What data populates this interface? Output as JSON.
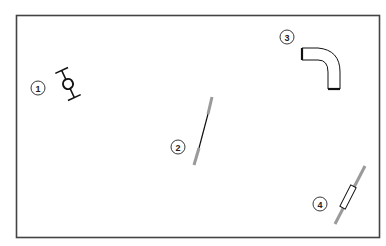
{
  "diagram": {
    "title": "",
    "callouts": [
      {
        "number": "1",
        "part": "valve-fitting"
      },
      {
        "number": "2",
        "part": "straight-rod"
      },
      {
        "number": "3",
        "part": "elbow-pipe"
      },
      {
        "number": "4",
        "part": "sleeved-rod"
      }
    ],
    "colors": {
      "frame": "#444444",
      "line": "#111111",
      "rod": "#9a9a9a"
    }
  }
}
